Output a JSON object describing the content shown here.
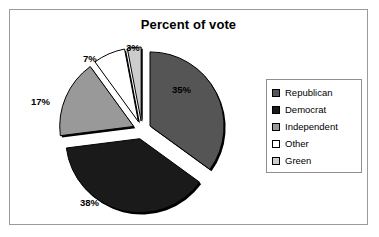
{
  "chart": {
    "title": "Percent of vote",
    "frame_border_color": "#9a9a9a",
    "background_color": "#ffffff"
  },
  "legend": {
    "border_color": "#8f8f8f",
    "entries": [
      {
        "label": "Republican",
        "color": "#555555",
        "swatch_name": "legend-swatch-republican"
      },
      {
        "label": "Democrat",
        "color": "#1a1a1a",
        "swatch_name": "legend-swatch-democrat"
      },
      {
        "label": "Independent",
        "color": "#999999",
        "swatch_name": "legend-swatch-independent"
      },
      {
        "label": "Other",
        "color": "#ffffff",
        "swatch_name": "legend-swatch-other"
      },
      {
        "label": "Green",
        "color": "#cccccc",
        "swatch_name": "legend-swatch-green"
      }
    ]
  },
  "labels": {
    "republican": "35%",
    "democrat": "38%",
    "independent": "17%",
    "other": "7%",
    "green": "3%"
  },
  "chart_data": {
    "type": "pie",
    "title": "Percent of vote",
    "xlabel": "",
    "ylabel": "",
    "unit": "percent",
    "exploded": true,
    "start_angle_deg": 0,
    "direction": "clockwise",
    "legend_position": "right",
    "grid": false,
    "categories": [
      "Republican",
      "Democrat",
      "Independent",
      "Other",
      "Green"
    ],
    "values": [
      35,
      38,
      17,
      7,
      3
    ],
    "data_labels": [
      "35%",
      "38%",
      "17%",
      "7%",
      "3%"
    ],
    "colors": [
      "#555555",
      "#1a1a1a",
      "#999999",
      "#ffffff",
      "#cccccc"
    ],
    "slices": [
      {
        "name": "Republican",
        "value": 35,
        "label": "35%",
        "color": "#555555"
      },
      {
        "name": "Democrat",
        "value": 38,
        "label": "38%",
        "color": "#1a1a1a"
      },
      {
        "name": "Independent",
        "value": 17,
        "label": "17%",
        "color": "#999999"
      },
      {
        "name": "Other",
        "value": 7,
        "label": "7%",
        "color": "#ffffff"
      },
      {
        "name": "Green",
        "value": 3,
        "label": "3%",
        "color": "#cccccc"
      }
    ]
  },
  "geometry": {
    "cx": 120,
    "cy": 96,
    "r": 74,
    "explode": 9
  }
}
